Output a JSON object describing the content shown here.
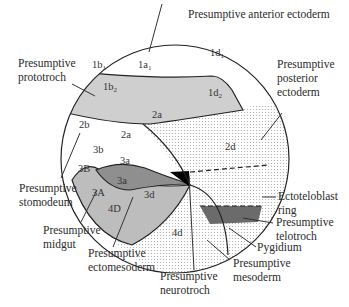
{
  "colors": {
    "prototroch": "#cfcfcf",
    "posterior_ectoderm_stipple": "#b8b8b8",
    "midgut": "#bdbdbd",
    "ectomesoderm": "#8f8f8f",
    "neurotroch": "#000000",
    "telotroch": "#6b6b6b",
    "outline": "#222222"
  },
  "labels": {
    "anterior_ectoderm": "Presumptive anterior ectoderm",
    "prototroch": [
      "Presumptive",
      "prototroch"
    ],
    "posterior_ectoderm": [
      "Presumptive",
      "posterior",
      "ectoderm"
    ],
    "stomodeum": [
      "Presumptive",
      "stomodeum"
    ],
    "midgut": [
      "Presumptive",
      "midgut"
    ],
    "ectomesoderm": [
      "Presumptive",
      "ectomesoderm"
    ],
    "neurotroch": [
      "Presumptive",
      "neurotroch"
    ],
    "mesoderm": [
      "Presumptive",
      "mesoderm"
    ],
    "pygidium": "Pygidium",
    "telotroch": [
      "Presumptive",
      "telotroch"
    ],
    "ectoteloblast": [
      "Ectoteloblast",
      "ring"
    ]
  },
  "cells": {
    "1b1": {
      "base": "1b",
      "sub": "1"
    },
    "1a1": {
      "base": "1a",
      "sub": "1"
    },
    "1d1": {
      "base": "1d",
      "sub": "1"
    },
    "1b2": {
      "base": "1b",
      "sub": "2"
    },
    "1d2": {
      "base": "1d",
      "sub": "2"
    },
    "2a_upper": "2a",
    "2b": "2b",
    "2a": "2a",
    "2d": "2d",
    "3b": "3b",
    "3a_upper": "3a",
    "3B": "3B",
    "3a": "3a",
    "3A": "3A",
    "3d": "3d",
    "4D": "4D",
    "4d": "4d"
  }
}
